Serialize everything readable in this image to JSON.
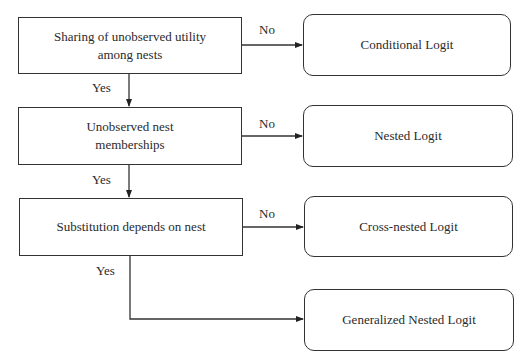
{
  "diagram": {
    "type": "decision-flowchart",
    "decisions": [
      {
        "id": "d1",
        "text": "Sharing of unobserved utility among nests",
        "line1": "Sharing of unobserved utility",
        "line2": "among nests"
      },
      {
        "id": "d2",
        "text": "Unobserved nest memberships",
        "line1": "Unobserved nest",
        "line2": "memberships"
      },
      {
        "id": "d3",
        "text": "Substitution depends on nest"
      }
    ],
    "outcomes": [
      {
        "id": "o1",
        "text": "Conditional Logit"
      },
      {
        "id": "o2",
        "text": "Nested Logit"
      },
      {
        "id": "o3",
        "text": "Cross-nested Logit"
      },
      {
        "id": "o4",
        "text": "Generalized Nested Logit"
      }
    ],
    "edges": [
      {
        "from": "d1",
        "to": "o1",
        "label": "No"
      },
      {
        "from": "d1",
        "to": "d2",
        "label": "Yes"
      },
      {
        "from": "d2",
        "to": "o2",
        "label": "No"
      },
      {
        "from": "d2",
        "to": "d3",
        "label": "Yes"
      },
      {
        "from": "d3",
        "to": "o3",
        "label": "No"
      },
      {
        "from": "d3",
        "to": "o4",
        "label": "Yes"
      }
    ],
    "labels": {
      "no": "No",
      "yes": "Yes"
    }
  }
}
